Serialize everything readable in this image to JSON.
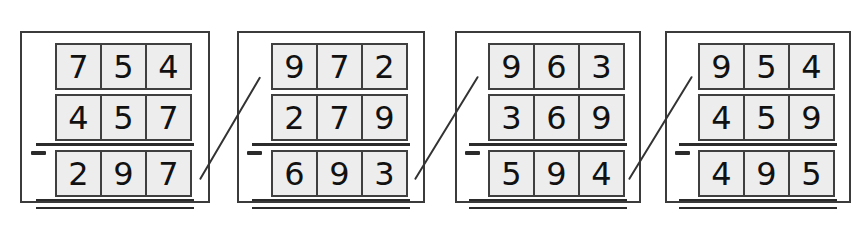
{
  "worksheet": {
    "title": "Three-digit subtraction worksheet",
    "operator_symbol": "−",
    "problem_count": 4,
    "colors": {
      "panel_border": "#3b3b3b",
      "cell_fill": "#ededed",
      "cell_border": "#3f3f3f",
      "ink": "#2b2b2b",
      "background": "#ffffff"
    },
    "problems": [
      {
        "id": "problem-1",
        "operator": "−",
        "minuend": [
          "7",
          "5",
          "4"
        ],
        "subtrahend": [
          "4",
          "5",
          "7"
        ],
        "answer": [
          "2",
          "9",
          "7"
        ],
        "minuend_value": "754",
        "subtrahend_value": "457",
        "answer_value": "297"
      },
      {
        "id": "problem-2",
        "operator": "−",
        "minuend": [
          "9",
          "7",
          "2"
        ],
        "subtrahend": [
          "2",
          "7",
          "9"
        ],
        "answer": [
          "6",
          "9",
          "3"
        ],
        "minuend_value": "972",
        "subtrahend_value": "279",
        "answer_value": "693"
      },
      {
        "id": "problem-3",
        "operator": "−",
        "minuend": [
          "9",
          "6",
          "3"
        ],
        "subtrahend": [
          "3",
          "6",
          "9"
        ],
        "answer": [
          "5",
          "9",
          "4"
        ],
        "minuend_value": "963",
        "subtrahend_value": "369",
        "answer_value": "594"
      },
      {
        "id": "problem-4",
        "operator": "−",
        "minuend": [
          "9",
          "5",
          "4"
        ],
        "subtrahend": [
          "4",
          "5",
          "9"
        ],
        "answer": [
          "4",
          "9",
          "5"
        ],
        "minuend_value": "954",
        "subtrahend_value": "459",
        "answer_value": "495"
      }
    ],
    "separators": [
      {
        "id": "slash-1",
        "between": "problem-1-and-problem-2"
      },
      {
        "id": "slash-2",
        "between": "problem-2-and-problem-3"
      },
      {
        "id": "slash-3",
        "between": "problem-3-and-problem-4"
      }
    ]
  }
}
